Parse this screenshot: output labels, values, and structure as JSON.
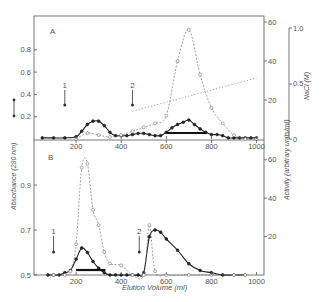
{
  "chart_data": [
    {
      "panel": "A",
      "type": "line",
      "xlabel": "Elution Volume (ml)",
      "ylabel_left": "Absorbance (280 nm)",
      "ylabel_right": "Activity (arbitrary units/ml)",
      "ylabel_right2": "NaCl (M)",
      "xticks": [
        200,
        400,
        600,
        800,
        1000
      ],
      "xlim": [
        0,
        1050
      ],
      "yticks_left": [
        0.2,
        0.4,
        0.6,
        0.8
      ],
      "ylim_left": [
        0,
        1.0
      ],
      "yticks_right": [
        20,
        40,
        60
      ],
      "ylim_right": [
        0,
        62
      ],
      "yticks_right2": [
        0,
        0.5,
        1.0
      ],
      "ylim_right2": [
        0,
        1.0
      ],
      "arrows": [
        {
          "label": "1",
          "x": 150
        },
        {
          "label": "2",
          "x": 450
        }
      ],
      "bar": {
        "x_start": 600,
        "x_end": 780
      },
      "series": [
        {
          "name": "Absorbance (280 nm)",
          "style": "solid-filled-circles",
          "axis": "left",
          "x": [
            50,
            100,
            150,
            200,
            225,
            250,
            275,
            300,
            325,
            350,
            375,
            400,
            425,
            450,
            475,
            500,
            525,
            550,
            575,
            600,
            625,
            650,
            675,
            700,
            725,
            750,
            775,
            800,
            825,
            850,
            875,
            900,
            925,
            950,
            975,
            1000
          ],
          "values": [
            0.01,
            0.01,
            0.01,
            0.02,
            0.07,
            0.13,
            0.16,
            0.16,
            0.12,
            0.06,
            0.03,
            0.03,
            0.03,
            0.04,
            0.05,
            0.05,
            0.04,
            0.03,
            0.03,
            0.06,
            0.1,
            0.13,
            0.15,
            0.17,
            0.13,
            0.09,
            0.06,
            0.04,
            0.04,
            0.03,
            0.01,
            0.01,
            0.01,
            0.01,
            0.01,
            0.01
          ]
        },
        {
          "name": "Activity (arbitrary units/ml)",
          "style": "dashed-open-circles",
          "axis": "right",
          "x": [
            200,
            250,
            300,
            350,
            400,
            450,
            500,
            550,
            600,
            650,
            700,
            750,
            800,
            850,
            900,
            950,
            1000
          ],
          "values": [
            0,
            3,
            2,
            1,
            2,
            4,
            6,
            8,
            12,
            40,
            56,
            33,
            16,
            8,
            2,
            0,
            0
          ]
        },
        {
          "name": "NaCl (M)",
          "style": "dotted",
          "axis": "right2",
          "x": [
            450,
            1000
          ],
          "values": [
            0.25,
            0.55
          ]
        }
      ]
    },
    {
      "panel": "B",
      "type": "line",
      "xlabel": "Elution Volume (ml)",
      "ylabel_left": "Absorbance (280 nm)",
      "ylabel_right": "Activity (arbitrary units/ml)",
      "xticks": [
        200,
        400,
        600,
        800,
        1000
      ],
      "xlim": [
        0,
        1050
      ],
      "yticks_left": [
        0.5,
        0.7,
        0.9
      ],
      "ylim_left": [
        0.5,
        1.1
      ],
      "yticks_right": [
        20,
        40,
        60
      ],
      "ylim_right": [
        0,
        70
      ],
      "arrows": [
        {
          "label": "1",
          "x": 100
        },
        {
          "label": "2",
          "x": 480
        }
      ],
      "bar": {
        "x_start": 200,
        "x_end": 330
      },
      "series": [
        {
          "name": "Absorbance (280 nm)",
          "style": "solid-filled-circles",
          "axis": "left",
          "x": [
            75,
            100,
            125,
            150,
            175,
            200,
            225,
            250,
            275,
            300,
            325,
            350,
            375,
            400,
            425,
            450,
            475,
            500,
            525,
            550,
            575,
            600,
            650,
            700,
            750,
            800,
            850,
            900,
            950
          ],
          "values": [
            0.5,
            0.5,
            0.5,
            0.51,
            0.52,
            0.57,
            0.62,
            0.6,
            0.56,
            0.53,
            0.51,
            0.5,
            0.5,
            0.5,
            0.5,
            0.5,
            0.5,
            0.51,
            0.67,
            0.7,
            0.69,
            0.66,
            0.61,
            0.55,
            0.52,
            0.51,
            0.5,
            0.5,
            0.5
          ]
        },
        {
          "name": "Activity (arbitrary units/ml)",
          "style": "dashed-open-circles",
          "axis": "right",
          "x": [
            100,
            150,
            175,
            200,
            225,
            250,
            275,
            300,
            325,
            350,
            400,
            450,
            500,
            525,
            550,
            600,
            700,
            800,
            900,
            950
          ],
          "values": [
            0,
            0,
            2,
            16,
            56,
            58,
            34,
            26,
            12,
            6,
            5,
            0,
            0,
            26,
            2,
            0,
            0,
            0,
            0,
            0
          ]
        }
      ]
    }
  ],
  "labels": {
    "panel_a": "A",
    "panel_b": "B",
    "arrow_1": "1",
    "arrow_2": "2",
    "xlabel": "Elution Volume (ml)",
    "ylabel_left": "Absorbance (280 nm)",
    "ylabel_right": "Activity (arbitrary units/ml)",
    "ylabel_right2": "NaCl (M)",
    "x_ticks": [
      "200",
      "400",
      "600",
      "800",
      "1000"
    ],
    "a_left_ticks": [
      "0.2",
      "0.4",
      "0.6",
      "0.8"
    ],
    "b_left_ticks": [
      "0.5",
      "0.7",
      "0.9"
    ],
    "right_ticks": [
      "20",
      "40",
      "60"
    ],
    "nacl_ticks": [
      "0",
      "0.5",
      "1.0"
    ]
  }
}
